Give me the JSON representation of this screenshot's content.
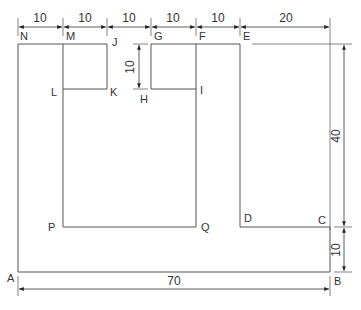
{
  "diagram": {
    "type": "dimensioned-floor-plan",
    "points": {
      "N": "N",
      "M": "M",
      "J": "J",
      "G": "G",
      "F": "F",
      "E": "E",
      "L": "L",
      "K": "K",
      "H": "H",
      "I": "I",
      "P": "P",
      "Q": "Q",
      "D": "D",
      "C": "C",
      "A": "A",
      "B": "B"
    },
    "top_dimensions": [
      "10",
      "10",
      "10",
      "10",
      "10",
      "20"
    ],
    "left_dimension_GH": "10",
    "right_dimension_EC": "40",
    "right_dimension_CB": "10",
    "bottom_dimension_AB": "70"
  }
}
